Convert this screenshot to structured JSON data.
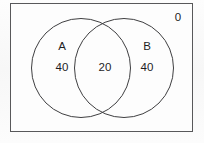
{
  "figure": {
    "type": "venn-diagram",
    "sets": 2,
    "border_color": "#58585a",
    "circle_color": "#3f3f41",
    "text_color": "#1d1d1f",
    "background_color": "#fdfdfd"
  },
  "labels": {
    "set_a_name": "A",
    "set_b_name": "B"
  },
  "values": {
    "a_only": "40",
    "intersection": "20",
    "b_only": "40",
    "outside": "0"
  }
}
